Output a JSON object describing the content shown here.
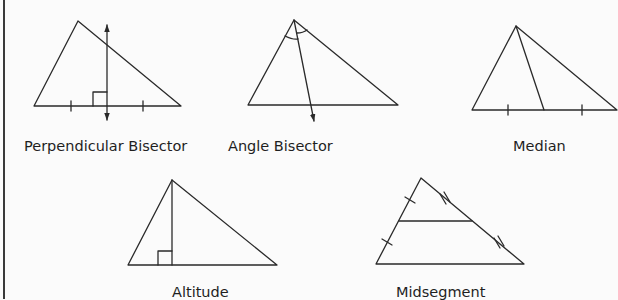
{
  "figure": {
    "diagrams": [
      {
        "id": "perpendicular-bisector",
        "label": "Perpendicular Bisector"
      },
      {
        "id": "angle-bisector",
        "label": "Angle Bisector"
      },
      {
        "id": "median",
        "label": "Median"
      },
      {
        "id": "altitude",
        "label": "Altitude"
      },
      {
        "id": "midsegment",
        "label": "Midsegment"
      }
    ]
  },
  "colors": {
    "stroke": "#2a2a2a",
    "background": "#fbfbfb",
    "text": "#1f1f1f"
  }
}
